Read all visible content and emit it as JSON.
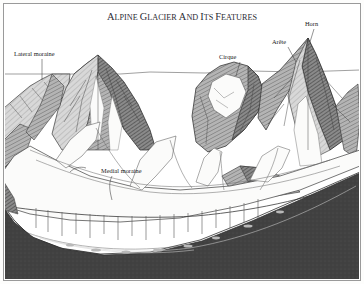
{
  "figure": {
    "title": "ALPINE GLACIER AND ITS FEATURES",
    "title_words": [
      {
        "cap": "A",
        "rest": "LPINE"
      },
      {
        "cap": "G",
        "rest": "LACIER"
      },
      {
        "cap": "A",
        "rest": "ND"
      },
      {
        "cap": "I",
        "rest": "TS"
      },
      {
        "cap": "F",
        "rest": "EATURES"
      }
    ],
    "style": "engraving",
    "colors": {
      "background": "#fdfdfc",
      "border": "#9a9a9a",
      "ink": "#1a1a1a",
      "rock_dark": "#4a4a4a",
      "rock_mid": "#8d8d8d",
      "rock_light": "#c3c3c3",
      "bedrock": "#3f3f3f",
      "ice": "#fbfbfa",
      "title": "#2b2b33"
    },
    "labels": [
      {
        "id": "lateral-moraine",
        "text": "Lateral moraine",
        "x": 14,
        "y": 56,
        "anchor": "start"
      },
      {
        "id": "medial-moraine",
        "text": "Medial moraine",
        "x": 101,
        "y": 173,
        "anchor": "start"
      },
      {
        "id": "cirque",
        "text": "Cirque",
        "x": 219,
        "y": 59,
        "anchor": "start"
      },
      {
        "id": "arete",
        "text": "Arête",
        "x": 272,
        "y": 44,
        "anchor": "start"
      },
      {
        "id": "horn",
        "text": "Horn",
        "x": 305,
        "y": 26,
        "anchor": "start"
      }
    ]
  }
}
